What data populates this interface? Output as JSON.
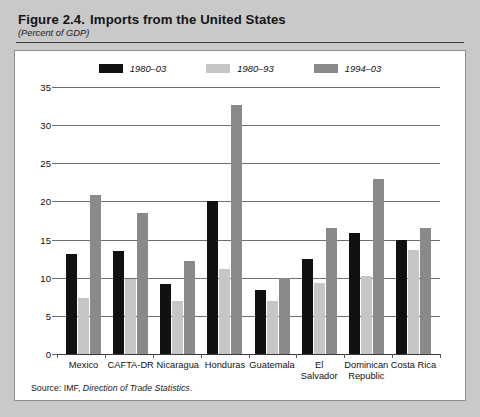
{
  "figure": {
    "number": "Figure 2.4.",
    "title": "Imports from the United States",
    "subtitle": "(Percent of GDP)",
    "source_prefix": "Source: IMF,",
    "source_italic": "Direction of Trade Statistics",
    "source_suffix": "."
  },
  "colors": {
    "series_1980_03": "#111111",
    "series_1980_93": "#c6c6c6",
    "series_1994_03": "#8a8a8a",
    "panel_background": "#ffffff",
    "page_background": "#c9c9c9",
    "gridline": "#6f6f6f",
    "axis": "#3b3b3b"
  },
  "chart_data": {
    "type": "bar",
    "title": "Imports from the United States",
    "subtitle": "(Percent of GDP)",
    "xlabel": "",
    "ylabel": "",
    "ylim": [
      0,
      35
    ],
    "yticks": [
      0,
      5,
      10,
      15,
      20,
      25,
      30,
      35
    ],
    "ytick_labels": [
      "0",
      "5",
      "10",
      "15",
      "20",
      "25",
      "30",
      "35"
    ],
    "grid": true,
    "legend_position": "top-center",
    "categories": [
      "Mexico",
      "CAFTA-DR",
      "Nicaragua",
      "Honduras",
      "Guatemala",
      "El Salvador",
      "Dominican Republic",
      "Costa Rica"
    ],
    "category_lines": [
      [
        "Mexico"
      ],
      [
        "CAFTA-DR"
      ],
      [
        "Nicaragua"
      ],
      [
        "Honduras"
      ],
      [
        "Guatemala"
      ],
      [
        "El Salvador"
      ],
      [
        "Dominican",
        "Republic"
      ],
      [
        "Costa Rica"
      ]
    ],
    "series": [
      {
        "name": "1980–03",
        "color": "#111111",
        "values": [
          13.1,
          13.5,
          9.2,
          20.0,
          8.4,
          12.4,
          15.9,
          14.9
        ]
      },
      {
        "name": "1980–93",
        "color": "#c6c6c6",
        "values": [
          7.4,
          9.8,
          6.9,
          11.2,
          6.9,
          9.3,
          10.2,
          13.6
        ]
      },
      {
        "name": "1994–03",
        "color": "#8a8a8a",
        "values": [
          20.9,
          18.5,
          12.2,
          32.7,
          10.0,
          16.5,
          22.9,
          16.5
        ]
      }
    ]
  }
}
